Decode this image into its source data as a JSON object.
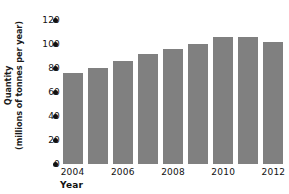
{
  "chart_data": {
    "type": "bar",
    "title": "",
    "xlabel": "Year",
    "ylabel": "Quantity (millions of tonnes per year)",
    "ylabel_line1": "Quantity",
    "ylabel_line2": "(millions of tonnes per year)",
    "categories": [
      "2004",
      "2005",
      "2006",
      "2007",
      "2008",
      "2009",
      "2010",
      "2011",
      "2012"
    ],
    "values": [
      76,
      80,
      86,
      92,
      96,
      100,
      106,
      106,
      102
    ],
    "ylim": [
      0,
      120
    ],
    "yticks": [
      0,
      20,
      40,
      60,
      80,
      100,
      120
    ],
    "ytick_labels": [
      "0",
      "20",
      "40",
      "60",
      "80",
      "100",
      "120"
    ],
    "xtick_labels": [
      "2004",
      "2006",
      "2008",
      "2010",
      "2012"
    ],
    "xtick_categories": [
      "2004",
      "2006",
      "2008",
      "2010",
      "2012"
    ],
    "grid": false,
    "legend": false,
    "bar_color": "#808080",
    "axis_text_color": "#111111",
    "background_color": "#ffffff"
  }
}
